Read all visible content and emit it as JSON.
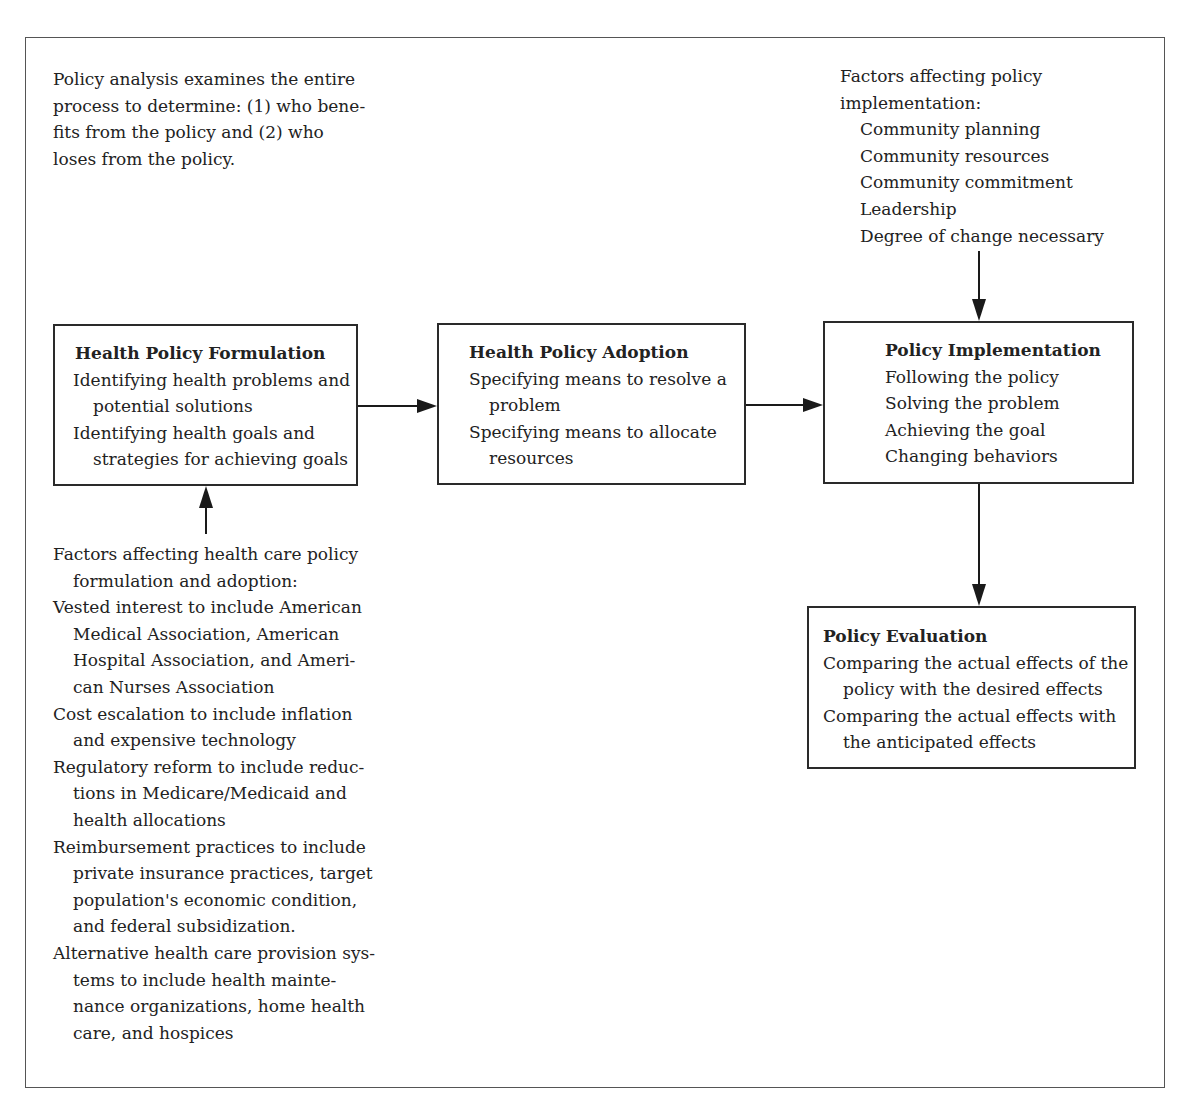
{
  "intro_note": {
    "lines": [
      "Policy analysis examines the entire",
      "process to determine: (1) who bene-",
      "fits from the policy and (2) who",
      "loses from the policy."
    ]
  },
  "implementation_factors": {
    "heading_lines": [
      "Factors affecting policy",
      "implementation:"
    ],
    "items": [
      "Community planning",
      "Community resources",
      "Community commitment",
      "Leadership",
      "Degree of change necessary"
    ]
  },
  "boxes": {
    "formulation": {
      "title": "Health Policy Formulation",
      "lines": [
        {
          "text": "Identifying health problems and",
          "indent": false
        },
        {
          "text": "potential solutions",
          "indent": true
        },
        {
          "text": "Identifying health goals and",
          "indent": false
        },
        {
          "text": "strategies for achieving goals",
          "indent": true
        }
      ]
    },
    "adoption": {
      "title": "Health Policy Adoption",
      "lines": [
        {
          "text": "Specifying means to resolve a",
          "indent": false
        },
        {
          "text": "problem",
          "indent": true
        },
        {
          "text": "Specifying means to allocate",
          "indent": false
        },
        {
          "text": "resources",
          "indent": true
        }
      ]
    },
    "implementation": {
      "title": "Policy Implementation",
      "lines": [
        {
          "text": "Following the policy",
          "indent": false
        },
        {
          "text": "Solving the problem",
          "indent": false
        },
        {
          "text": "Achieving the goal",
          "indent": false
        },
        {
          "text": "Changing behaviors",
          "indent": false
        }
      ]
    },
    "evaluation": {
      "title": "Policy Evaluation",
      "lines": [
        {
          "text": "Comparing the actual effects of the",
          "indent": false
        },
        {
          "text": "policy with the desired effects",
          "indent": true
        },
        {
          "text": "Comparing the actual effects with",
          "indent": false
        },
        {
          "text": "the anticipated effects",
          "indent": true
        }
      ]
    }
  },
  "formulation_factors": {
    "lines": [
      {
        "text": "Factors affecting health care policy",
        "indent": false
      },
      {
        "text": "formulation and adoption:",
        "indent": true
      },
      {
        "text": "Vested interest to include American",
        "indent": false
      },
      {
        "text": "Medical Association, American",
        "indent": true
      },
      {
        "text": "Hospital Association, and Ameri-",
        "indent": true
      },
      {
        "text": "can Nurses Association",
        "indent": true
      },
      {
        "text": "Cost escalation to include inflation",
        "indent": false
      },
      {
        "text": "and expensive technology",
        "indent": true
      },
      {
        "text": "Regulatory reform to include reduc-",
        "indent": false
      },
      {
        "text": "tions in Medicare/Medicaid and",
        "indent": true
      },
      {
        "text": "health allocations",
        "indent": true
      },
      {
        "text": "Reimbursement practices to include",
        "indent": false
      },
      {
        "text": "private insurance practices, target",
        "indent": true
      },
      {
        "text": "population's economic condition,",
        "indent": true
      },
      {
        "text": "and federal subsidization.",
        "indent": true
      },
      {
        "text": "Alternative health care provision sys-",
        "indent": false
      },
      {
        "text": "tems to include health mainte-",
        "indent": true
      },
      {
        "text": "nance organizations, home health",
        "indent": true
      },
      {
        "text": "care, and hospices",
        "indent": true
      }
    ]
  },
  "colors": {
    "line": "#1a1a1a",
    "border": "#2a2a2a",
    "text": "#222222"
  }
}
